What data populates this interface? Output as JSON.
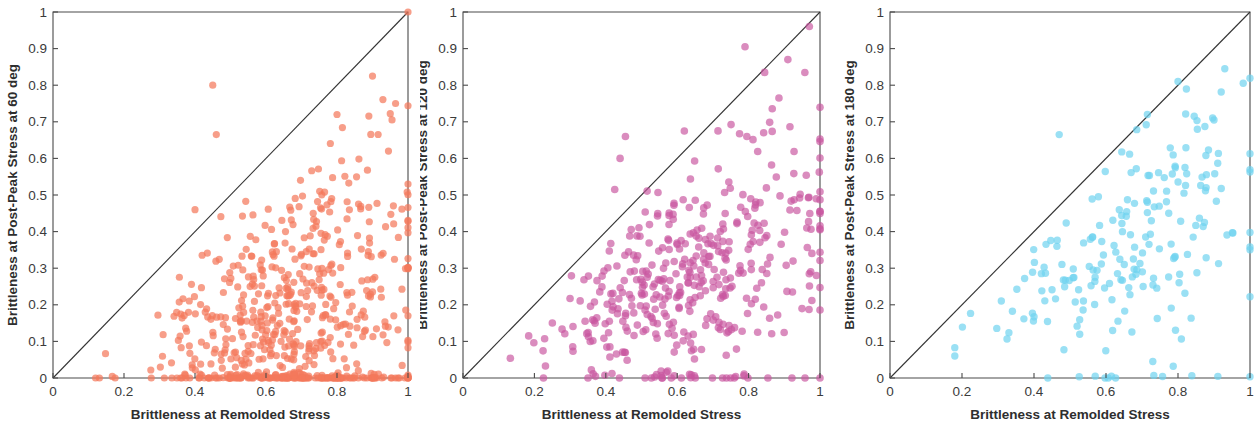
{
  "figure": {
    "background": "#ffffff",
    "width": 1258,
    "height": 423
  },
  "chart_data": [
    {
      "type": "scatter",
      "panel_index": 0,
      "title": "",
      "xlabel": "Brittleness at Remolded Stress",
      "ylabel": "Brittleness at Post-Peak Stress at 60 deg",
      "xlim": [
        0,
        1
      ],
      "ylim": [
        0,
        1
      ],
      "xticks": [
        0,
        0.2,
        0.4,
        0.6,
        0.8,
        1
      ],
      "yticks": [
        0,
        0.1,
        0.2,
        0.3,
        0.4,
        0.5,
        0.6,
        0.7,
        0.8,
        0.9,
        1
      ],
      "xticklabels": [
        "0",
        "0.2",
        "0.4",
        "0.6",
        "0.8",
        "1"
      ],
      "yticklabels": [
        "0",
        "0.1",
        "0.2",
        "0.3",
        "0.4",
        "0.5",
        "0.6",
        "0.7",
        "0.8",
        "0.9",
        "1"
      ],
      "grid": false,
      "legend": null,
      "marker_color": "#F4795B",
      "marker_opacity": 0.72,
      "marker_size": 7.2,
      "reference_line": {
        "type": "identity",
        "from": [
          0,
          0
        ],
        "to": [
          1,
          1
        ],
        "color": "#333333"
      },
      "n_points": 640,
      "seed": 17,
      "distribution": {
        "x_mode": 0.68,
        "x_spread": 0.19,
        "x_min": 0.12,
        "y_ratio_mean": 0.29,
        "y_ratio_spread": 0.24,
        "zero_fraction": 0.16,
        "outliers": [
          [
            0.45,
            0.8
          ],
          [
            0.46,
            0.665
          ],
          [
            0.4,
            0.46
          ],
          [
            0.9,
            0.825
          ],
          [
            0.965,
            0.75
          ],
          [
            0.955,
            0.705
          ],
          [
            0.8,
            0.72
          ],
          [
            1.0,
            1.0
          ],
          [
            0.945,
            0.62
          ]
        ]
      }
    },
    {
      "type": "scatter",
      "panel_index": 1,
      "title": "",
      "xlabel": "Brittleness at Remolded Stress",
      "ylabel": "Brittleness at Post-Peak Stress at 120 deg",
      "xlim": [
        0,
        1
      ],
      "ylim": [
        0,
        1
      ],
      "xticks": [
        0,
        0.2,
        0.4,
        0.6,
        0.8,
        1
      ],
      "yticks": [
        0,
        0.1,
        0.2,
        0.3,
        0.4,
        0.5,
        0.6,
        0.7,
        0.8,
        0.9,
        1
      ],
      "xticklabels": [
        "0",
        "0.2",
        "0.4",
        "0.6",
        "0.8",
        "1"
      ],
      "yticklabels": [
        "0",
        "0.1",
        "0.2",
        "0.3",
        "0.4",
        "0.5",
        "0.6",
        "0.7",
        "0.8",
        "0.9",
        "1"
      ],
      "grid": false,
      "legend": null,
      "marker_color": "#C9569F",
      "marker_opacity": 0.68,
      "marker_size": 7.6,
      "reference_line": {
        "type": "identity",
        "from": [
          0,
          0
        ],
        "to": [
          1,
          1
        ],
        "color": "#333333"
      },
      "n_points": 430,
      "seed": 53,
      "distribution": {
        "x_mode": 0.66,
        "x_spread": 0.18,
        "x_min": 0.13,
        "y_ratio_mean": 0.45,
        "y_ratio_spread": 0.22,
        "zero_fraction": 0.06,
        "outliers": [
          [
            0.79,
            0.905
          ],
          [
            0.455,
            0.66
          ],
          [
            0.44,
            0.6
          ],
          [
            0.425,
            0.515
          ],
          [
            0.845,
            0.835
          ],
          [
            0.91,
            0.87
          ],
          [
            0.885,
            0.765
          ],
          [
            0.62,
            0.675
          ],
          [
            0.97,
            0.285
          ],
          [
            0.99,
            0.28
          ]
        ]
      }
    },
    {
      "type": "scatter",
      "panel_index": 2,
      "title": "",
      "xlabel": "Brittleness at Remolded Stress",
      "ylabel": "Brittleness at Post-Peak Stress at 180 deg",
      "xlim": [
        0,
        1
      ],
      "ylim": [
        0,
        1
      ],
      "xticks": [
        0,
        0.2,
        0.4,
        0.6,
        0.8,
        1
      ],
      "yticks": [
        0,
        0.1,
        0.2,
        0.3,
        0.4,
        0.5,
        0.6,
        0.7,
        0.8,
        0.9,
        1
      ],
      "xticklabels": [
        "0",
        "0.2",
        "0.4",
        "0.6",
        "0.8",
        "1"
      ],
      "yticklabels": [
        "0",
        "0.1",
        "0.2",
        "0.3",
        "0.4",
        "0.5",
        "0.6",
        "0.7",
        "0.8",
        "0.9",
        "1"
      ],
      "grid": false,
      "legend": null,
      "marker_color": "#6FD3EF",
      "marker_opacity": 0.7,
      "marker_size": 7.4,
      "reference_line": {
        "type": "identity",
        "from": [
          0,
          0
        ],
        "to": [
          1,
          1
        ],
        "color": "#333333"
      },
      "n_points": 205,
      "seed": 91,
      "distribution": {
        "x_mode": 0.67,
        "x_spread": 0.18,
        "x_min": 0.18,
        "y_ratio_mean": 0.56,
        "y_ratio_spread": 0.21,
        "zero_fraction": 0.05,
        "outliers": [
          [
            0.93,
            0.845
          ],
          [
            0.47,
            0.665
          ],
          [
            0.8,
            0.81
          ],
          [
            0.715,
            0.72
          ],
          [
            0.845,
            0.715
          ],
          [
            0.9,
            0.705
          ],
          [
            0.73,
            0.045
          ],
          [
            0.615,
            0.005
          ],
          [
            0.57,
            0.005
          ]
        ]
      }
    }
  ],
  "panels": [
    {
      "name": "panel-60-deg",
      "left": 0,
      "width": 420,
      "plot": {
        "x": 53,
        "y": 12,
        "w": 355,
        "h": 366
      }
    },
    {
      "name": "panel-120-deg",
      "left": 420,
      "width": 420,
      "plot": {
        "x": 43,
        "y": 12,
        "w": 357,
        "h": 366
      }
    },
    {
      "name": "panel-180-deg",
      "left": 840,
      "width": 418,
      "plot": {
        "x": 50,
        "y": 12,
        "w": 360,
        "h": 366
      }
    }
  ]
}
